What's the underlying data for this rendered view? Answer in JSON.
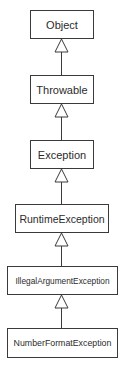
{
  "diagram": {
    "type": "class-inheritance-hierarchy",
    "classes": [
      {
        "name": "Object"
      },
      {
        "name": "Throwable"
      },
      {
        "name": "Exception"
      },
      {
        "name": "RuntimeException"
      },
      {
        "name": "IllegalArgumentException"
      },
      {
        "name": "NumberFormatException"
      }
    ],
    "relations": [
      {
        "from": "Throwable",
        "to": "Object",
        "kind": "generalization"
      },
      {
        "from": "Exception",
        "to": "Throwable",
        "kind": "generalization"
      },
      {
        "from": "RuntimeException",
        "to": "Exception",
        "kind": "generalization"
      },
      {
        "from": "IllegalArgumentException",
        "to": "RuntimeException",
        "kind": "generalization"
      },
      {
        "from": "NumberFormatException",
        "to": "IllegalArgumentException",
        "kind": "generalization"
      }
    ],
    "colors": {
      "line": "#3a3a3a",
      "text": "#2b2b2b",
      "background": "#ffffff"
    }
  }
}
